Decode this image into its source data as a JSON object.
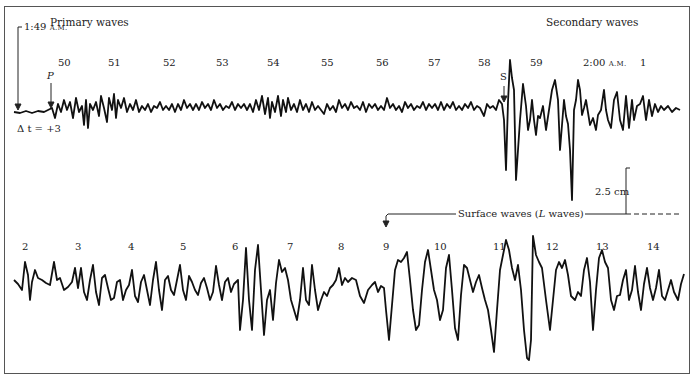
{
  "figure": {
    "title_primary": "Primary waves",
    "title_secondary": "Secondary waves",
    "start_time": "1:49",
    "start_ampm": "A.M.",
    "p_label": "P",
    "s_label": "S",
    "delta_t": "Δ t = +3",
    "time_2am": "2:00",
    "time_2am_ampm": "A.M.",
    "scale_label": "2.5 cm",
    "surface_label": "Surface waves (",
    "surface_label_italic": "L",
    "surface_label_end": " waves)",
    "top_minute_labels": [
      {
        "text": "50",
        "x": 58,
        "y": 58
      },
      {
        "text": "51",
        "x": 108,
        "y": 58
      },
      {
        "text": "52",
        "x": 163,
        "y": 58
      },
      {
        "text": "53",
        "x": 216,
        "y": 58
      },
      {
        "text": "54",
        "x": 267,
        "y": 58
      },
      {
        "text": "55",
        "x": 321,
        "y": 58
      },
      {
        "text": "56",
        "x": 376,
        "y": 58
      },
      {
        "text": "57",
        "x": 428,
        "y": 58
      },
      {
        "text": "58",
        "x": 478,
        "y": 58
      },
      {
        "text": "59",
        "x": 530,
        "y": 58
      },
      {
        "text": "1",
        "x": 640,
        "y": 58
      }
    ],
    "bottom_minute_labels": [
      {
        "text": "2",
        "x": 22,
        "y": 242
      },
      {
        "text": "3",
        "x": 75,
        "y": 242
      },
      {
        "text": "4",
        "x": 128,
        "y": 242
      },
      {
        "text": "5",
        "x": 180,
        "y": 242
      },
      {
        "text": "6",
        "x": 232,
        "y": 242
      },
      {
        "text": "7",
        "x": 287,
        "y": 242
      },
      {
        "text": "8",
        "x": 338,
        "y": 242
      },
      {
        "text": "9",
        "x": 383,
        "y": 242
      },
      {
        "text": "10",
        "x": 434,
        "y": 242
      },
      {
        "text": "11",
        "x": 493,
        "y": 242
      },
      {
        "text": "12",
        "x": 546,
        "y": 242
      },
      {
        "text": "13",
        "x": 596,
        "y": 242
      },
      {
        "text": "14",
        "x": 647,
        "y": 242
      }
    ],
    "colors": {
      "trace": "#111111",
      "border": "#555555",
      "text": "#222222"
    },
    "traces": {
      "top": "14,112 20,113 26,111 32,113 38,111 44,112 48,110 52,108 55,118 58,104 61,112 64,100 67,110 70,102 73,118 76,98 79,112 82,106 84,125 86,100 88,128 90,104 93,110 96,102 99,116 101,96 104,108 107,122 109,98 112,110 114,94 116,118 118,100 121,108 124,98 127,112 130,104 133,110 136,100 139,112 142,106 145,110 148,104 151,112 154,106 157,108 160,102 163,110 166,106 169,110 172,104 175,112 178,104 181,110 184,100 187,108 190,104 193,110 196,104 199,110 202,102 205,108 208,104 211,110 214,100 217,108 220,104 223,110 226,106 229,108 232,102 235,110 238,104 241,108 244,104 247,110 250,104 253,112 256,100 259,110 262,96 265,114 268,98 270,118 272,102 275,112 278,96 281,116 283,100 286,112 288,98 291,110 294,104 297,112 300,100 303,110 306,104 309,112 312,102 315,110 318,106 321,110 324,114 327,104 330,110 333,106 336,112 339,100 342,108 345,104 348,110 351,102 354,108 357,106 360,110 363,102 366,112 369,104 372,108 375,104 378,110 381,106 384,110 387,98 390,108 393,104 396,110 399,106 402,112 405,102 408,108 411,104 414,110 417,106 420,108 423,102 426,110 429,104 432,108 435,104 438,110 441,102 444,110 447,104 450,108 453,102 456,110 459,106 462,110 465,104 468,108 471,102 474,110 477,106 480,108 484,116 487,104 490,108 493,106 496,110 499,100 502,104 504,120 506,170 508,102 510,60 512,78 514,90 516,180 518,150 520,120 523,84 526,106 528,130 530,120 532,100 534,120 536,135 538,116 540,118 543,106 546,130 549,110 552,90 555,80 558,100 560,150 562,125 564,100 566,116 568,124 570,150 572,200 574,110 576,100 578,80 580,90 582,115 584,108 586,100 590,125 593,118 596,130 598,115 601,110 604,90 606,110 608,120 611,128 614,100 617,92 620,120 623,130 626,96 629,128 632,100 634,120 637,106 640,104 643,96 646,120 649,100 652,116 655,104 658,112 661,106 664,110 668,106 672,112 676,108 680,110",
      "bottom": "14,280 18,284 22,290 25,262 28,275 30,300 32,282 35,270 38,278 42,280 46,283 50,285 54,262 57,280 60,278 64,290 68,287 72,282 75,268 78,288 81,268 84,292 87,300 90,280 93,265 96,292 99,305 102,278 105,275 108,288 111,300 114,298 117,282 120,280 123,300 126,290 129,285 132,270 135,296 138,302 141,282 144,275 147,290 150,305 153,280 156,262 159,290 162,310 165,280 168,276 171,290 174,295 177,280 180,265 183,290 186,300 189,276 192,282 195,290 198,295 201,283 204,278 207,288 210,300 213,292 216,266 219,285 222,300 225,282 228,278 231,292 234,284 238,280 240,330 243,300 246,248 249,300 252,330 255,270 258,245 261,290 264,335 267,300 270,290 273,320 276,283 279,260 282,272 285,268 288,280 291,300 294,310 297,320 300,300 303,268 306,300 309,305 312,265 315,290 318,310 321,300 324,292 327,296 330,288 333,285 336,280 339,268 342,285 345,278 348,282 352,278 356,280 360,296 364,303 368,290 372,285 375,282 378,292 381,286 384,288 386,310 389,340 392,305 395,270 398,260 401,262 404,258 407,252 410,280 413,310 416,330 419,325 422,290 425,262 428,250 431,270 434,290 437,300 440,320 443,310 446,268 449,255 452,290 455,328 458,340 461,295 464,265 467,268 470,280 473,292 476,282 479,275 482,288 485,300 488,310 491,330 494,352 497,310 500,270 503,255 506,240 509,250 512,268 515,280 518,265 521,290 524,330 527,358 529,360 531,340 533,236 536,255 539,262 542,268 546,300 550,330 553,300 556,270 559,262 562,268 565,260 568,275 571,296 575,300 578,292 581,296 584,270 587,258 590,282 593,330 596,290 599,258 602,250 605,262 608,268 611,300 614,310 617,296 620,295 623,280 626,270 629,300 632,290 635,266 638,292 641,310 644,284 647,268 650,288 653,300 656,288 659,270 662,296 665,300 668,290 671,280 674,292 678,300 681,284 684,274"
    }
  }
}
